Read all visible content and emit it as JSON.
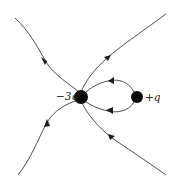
{
  "diagram": {
    "title": "",
    "type": "electric field lines",
    "charges": [
      {
        "id": "neg",
        "label": "−3q",
        "cx": 81,
        "cy": 97,
        "r": 7
      },
      {
        "id": "pos",
        "label": "+q",
        "cx": 137,
        "cy": 97,
        "r": 6
      }
    ],
    "field_lines": [
      {
        "name": "upper-left",
        "direction": "into −3q"
      },
      {
        "name": "upper-right",
        "direction": "into −3q"
      },
      {
        "name": "lower-left",
        "direction": "into −3q"
      },
      {
        "name": "lower-right",
        "direction": "into −3q"
      },
      {
        "name": "loop-top",
        "direction": "from +q to −3q"
      },
      {
        "name": "loop-bottom",
        "direction": "from +q to −3q"
      }
    ],
    "colors": {
      "line": "#3a3a3a",
      "charge": "#0a0a0a",
      "background": "#ffffff"
    }
  }
}
